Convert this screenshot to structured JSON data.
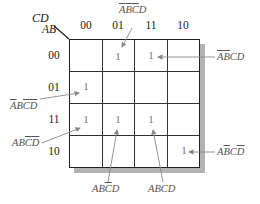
{
  "kmap": {
    "row_var": "AB",
    "col_var": "CD",
    "col_labels": [
      "00",
      "01",
      "11",
      "10"
    ],
    "row_labels": [
      "00",
      "01",
      "11",
      "10"
    ],
    "cells": [
      [
        "",
        "1",
        "1",
        ""
      ],
      [
        "1",
        "",
        "",
        ""
      ],
      [
        "1",
        "1",
        "1",
        ""
      ],
      [
        "",
        "",
        "",
        "1"
      ]
    ],
    "one_value": "1",
    "annotations": [
      {
        "row": "00",
        "col": "01",
        "term": "A'B'C'D"
      },
      {
        "row": "00",
        "col": "11",
        "term": "A'B'CD"
      },
      {
        "row": "01",
        "col": "00",
        "term": "A'BC'D'"
      },
      {
        "row": "11",
        "col": "00",
        "term": "ABC'D'"
      },
      {
        "row": "11",
        "col": "01",
        "term": "ABC'D"
      },
      {
        "row": "11",
        "col": "11",
        "term": "ABCD"
      },
      {
        "row": "10",
        "col": "10",
        "term": "AB'CD'"
      }
    ]
  },
  "colors": {
    "grid": "#222222",
    "shadow": "#b3b3b3",
    "arrow": "#888888",
    "label": "#555555"
  }
}
